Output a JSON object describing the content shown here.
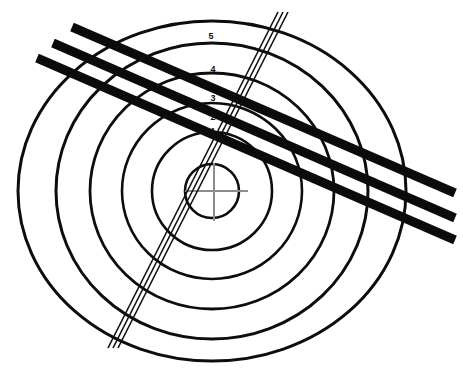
{
  "diagram": {
    "title": "Concentric range-ring target with overlaid track lines",
    "background_color": "#ffffff",
    "width": 463,
    "height": 376,
    "center": {
      "x": 212,
      "y": 191
    },
    "crosshair": {
      "name": "center-crosshair",
      "color": "#8c8c8c",
      "horizontal": {
        "x1": 185,
        "y1": 191,
        "x2": 248,
        "y2": 191
      },
      "vertical": {
        "x1": 214,
        "y1": 163,
        "x2": 214,
        "y2": 221
      }
    },
    "rings": [
      {
        "label": "1",
        "rx": 27,
        "ry": 27,
        "stroke_width": 2.6,
        "label_x": 213,
        "label_y": 134
      },
      {
        "label": "2",
        "rx": 60,
        "ry": 59,
        "stroke_width": 2.6,
        "label_x": 213,
        "label_y": 120
      },
      {
        "label": "3",
        "rx": 90,
        "ry": 88,
        "stroke_width": 2.6,
        "label_x": 213,
        "label_y": 101
      },
      {
        "label": "4",
        "rx": 122,
        "ry": 118,
        "stroke_width": 2.8,
        "label_x": 213,
        "label_y": 72
      },
      {
        "label": "5",
        "rx": 156,
        "ry": 148,
        "stroke_width": 3.0,
        "label_x": 211,
        "label_y": 39
      },
      {
        "label": "",
        "rx": 194,
        "ry": 170,
        "stroke_width": 3.0,
        "label_x": 0,
        "label_y": 0
      }
    ],
    "ring_labels": [
      "1",
      "2",
      "3",
      "4",
      "5"
    ],
    "thick_lines": {
      "name": "thick-diagonal-lines",
      "color": "#0b0b0b",
      "stroke_width": 9,
      "count": 3,
      "segments": [
        {
          "x1": 72,
          "y1": 27,
          "x2": 455,
          "y2": 193
        },
        {
          "x1": 53,
          "y1": 43,
          "x2": 455,
          "y2": 218
        },
        {
          "x1": 37,
          "y1": 58,
          "x2": 455,
          "y2": 240
        }
      ]
    },
    "rail_lines": {
      "name": "triple-rail-track",
      "color": "#101010",
      "stroke_width": 1.6,
      "count": 3,
      "segments": [
        {
          "x1": 288,
          "y1": 12,
          "x2": 118,
          "y2": 348
        },
        {
          "x1": 283,
          "y1": 12,
          "x2": 113,
          "y2": 348
        },
        {
          "x1": 278,
          "y1": 12,
          "x2": 108,
          "y2": 348
        }
      ]
    }
  }
}
